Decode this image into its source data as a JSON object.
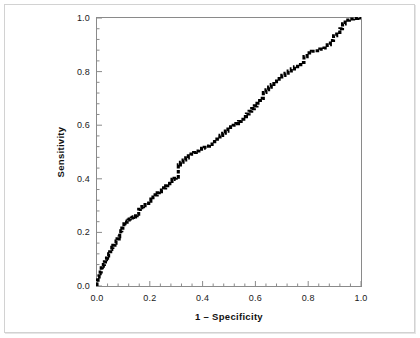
{
  "figure": {
    "background_color": "#ffffff",
    "frame_color": "#8a8a8a",
    "curve_color": "#000000"
  },
  "chart_data": {
    "type": "line",
    "title": "",
    "subtitle": "",
    "xlabel": "1 – Specificity",
    "ylabel": "Sensitivity",
    "xlim": [
      0.0,
      1.0
    ],
    "ylim": [
      0.0,
      1.0
    ],
    "grid": false,
    "legend": "none",
    "xticks": [
      0.0,
      0.2,
      0.4,
      0.6,
      0.8,
      1.0
    ],
    "yticks": [
      0.0,
      0.2,
      0.4,
      0.6,
      0.8,
      1.0
    ],
    "xtick_labels": [
      "0.0",
      "0.2",
      "0.4",
      "0.6",
      "0.8",
      "1.0"
    ],
    "ytick_labels": [
      "0.0",
      "0.2",
      "0.4",
      "0.6",
      "0.8",
      "1.0"
    ],
    "minor_ticks_per_interval": 4,
    "series": [
      {
        "name": "ROC curve",
        "style": "step-dotted",
        "x": [
          0.0,
          0.0,
          0.004,
          0.008,
          0.008,
          0.012,
          0.016,
          0.016,
          0.02,
          0.024,
          0.028,
          0.032,
          0.036,
          0.04,
          0.044,
          0.048,
          0.052,
          0.056,
          0.06,
          0.064,
          0.068,
          0.072,
          0.076,
          0.08,
          0.084,
          0.086,
          0.09,
          0.094,
          0.098,
          0.102,
          0.106,
          0.11,
          0.114,
          0.118,
          0.122,
          0.126,
          0.13,
          0.134,
          0.138,
          0.146,
          0.152,
          0.158,
          0.164,
          0.17,
          0.176,
          0.182,
          0.188,
          0.196,
          0.204,
          0.212,
          0.22,
          0.228,
          0.236,
          0.244,
          0.252,
          0.26,
          0.268,
          0.276,
          0.284,
          0.292,
          0.3,
          0.308,
          0.308,
          0.316,
          0.326,
          0.336,
          0.346,
          0.356,
          0.366,
          0.376,
          0.386,
          0.396,
          0.406,
          0.416,
          0.426,
          0.436,
          0.446,
          0.456,
          0.466,
          0.476,
          0.486,
          0.496,
          0.506,
          0.516,
          0.526,
          0.536,
          0.546,
          0.556,
          0.566,
          0.576,
          0.586,
          0.596,
          0.606,
          0.616,
          0.626,
          0.63,
          0.64,
          0.65,
          0.66,
          0.67,
          0.68,
          0.69,
          0.7,
          0.712,
          0.724,
          0.736,
          0.748,
          0.76,
          0.772,
          0.784,
          0.796,
          0.812,
          0.828,
          0.844,
          0.86,
          0.872,
          0.884,
          0.896,
          0.908,
          0.92,
          0.93,
          0.94,
          0.956,
          0.972,
          0.988,
          1.0
        ],
        "y": [
          0.0,
          0.022,
          0.034,
          0.034,
          0.046,
          0.052,
          0.058,
          0.068,
          0.074,
          0.08,
          0.09,
          0.098,
          0.104,
          0.112,
          0.12,
          0.128,
          0.136,
          0.144,
          0.152,
          0.152,
          0.16,
          0.168,
          0.176,
          0.176,
          0.184,
          0.196,
          0.206,
          0.216,
          0.222,
          0.232,
          0.238,
          0.238,
          0.242,
          0.246,
          0.25,
          0.252,
          0.254,
          0.256,
          0.258,
          0.262,
          0.268,
          0.286,
          0.292,
          0.296,
          0.3,
          0.304,
          0.308,
          0.316,
          0.324,
          0.332,
          0.34,
          0.348,
          0.352,
          0.358,
          0.366,
          0.374,
          0.382,
          0.39,
          0.398,
          0.402,
          0.406,
          0.41,
          0.452,
          0.462,
          0.47,
          0.478,
          0.486,
          0.492,
          0.498,
          0.504,
          0.51,
          0.514,
          0.518,
          0.522,
          0.528,
          0.538,
          0.548,
          0.556,
          0.562,
          0.57,
          0.578,
          0.586,
          0.594,
          0.6,
          0.606,
          0.614,
          0.622,
          0.632,
          0.642,
          0.652,
          0.662,
          0.672,
          0.682,
          0.692,
          0.7,
          0.722,
          0.732,
          0.742,
          0.752,
          0.762,
          0.772,
          0.78,
          0.786,
          0.794,
          0.802,
          0.81,
          0.818,
          0.826,
          0.834,
          0.856,
          0.87,
          0.876,
          0.878,
          0.884,
          0.888,
          0.9,
          0.916,
          0.934,
          0.946,
          0.96,
          0.978,
          0.992,
          0.996,
          0.998,
          1.0,
          1.0
        ]
      }
    ]
  }
}
